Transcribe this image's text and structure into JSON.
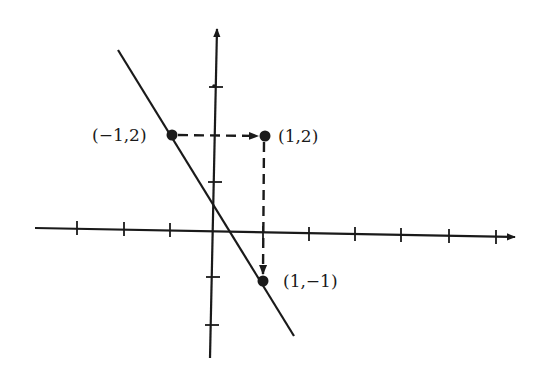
{
  "diagram": {
    "type": "coordinate-plane",
    "axes": {
      "x_ticks": [
        -3,
        -2,
        -1,
        0,
        1,
        2,
        3,
        4,
        5,
        6
      ],
      "y_ticks": [
        -2,
        -1,
        0,
        1,
        2,
        3
      ],
      "arrows": [
        "x-positive",
        "y-positive"
      ]
    },
    "line": {
      "through": [
        [
          -1,
          2
        ],
        [
          1,
          -1
        ]
      ],
      "slope": -1.5
    },
    "points": [
      {
        "id": "p1",
        "label": "(−1,2)",
        "x": -1,
        "y": 2
      },
      {
        "id": "p2",
        "label": "(1,2)",
        "x": 1,
        "y": 2
      },
      {
        "id": "p3",
        "label": "(1,−1)",
        "x": 1,
        "y": -1
      }
    ],
    "dashed_arrows": [
      {
        "from": "p1",
        "to": "p2",
        "direction": "horizontal"
      },
      {
        "from": "p2",
        "to": "p3",
        "direction": "vertical"
      }
    ],
    "colors": {
      "ink": "#1a1a1a",
      "background": "#ffffff"
    }
  }
}
